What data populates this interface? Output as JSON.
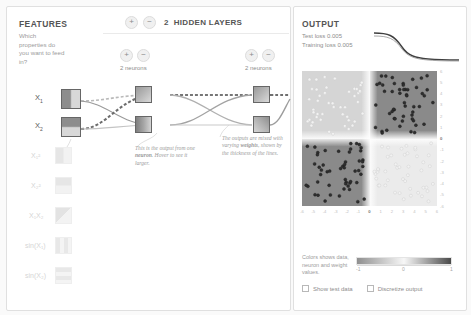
{
  "features": {
    "title": "FEATURES",
    "subtitle": "Which properties do you want to feed in?",
    "active": [
      {
        "label": "X",
        "sub": "1",
        "name": "input-x1"
      },
      {
        "label": "X",
        "sub": "2",
        "name": "input-x2"
      }
    ],
    "inactive": [
      {
        "label": "X₁²"
      },
      {
        "label": "X₂²"
      },
      {
        "label": "X₁X₂"
      },
      {
        "label": "sin(X₁)"
      },
      {
        "label": "sin(X₂)"
      }
    ]
  },
  "network": {
    "add_label": "+",
    "remove_label": "−",
    "layers_count": "2",
    "layers_label": "HIDDEN LAYERS",
    "layer1_neurons": "2 neurons",
    "layer2_neurons": "2 neurons"
  },
  "annotations": {
    "neuron_pre": "This is the output from one ",
    "neuron_bold": "neuron",
    "neuron_post": ". Hover to see it larger.",
    "weights_pre": "The outputs are mixed with varying ",
    "weights_bold": "weights",
    "weights_post": ", shown by the thickness of the lines."
  },
  "output": {
    "title": "OUTPUT",
    "test_loss": "Test loss 0.005",
    "training_loss": "Training loss 0.005",
    "x_ticks": [
      "-6",
      "-5",
      "-4",
      "-3",
      "-2",
      "-1",
      "0",
      "1",
      "2",
      "3",
      "4",
      "5",
      "6"
    ],
    "y_ticks": [
      "6",
      "5",
      "4",
      "3",
      "2",
      "1",
      "0",
      "-1",
      "-2",
      "-3",
      "-4",
      "-5",
      "-6"
    ],
    "legend_text": "Colors shows data, neuron and weight values.",
    "legend_min": "-1",
    "legend_mid": "0",
    "legend_max": "1",
    "show_test_data": "Show test data",
    "discretize_output": "Discretize output"
  },
  "colors": {
    "positive": "#4a4a4a",
    "negative": "#8f8f8f",
    "neutral": "#f7f7f7",
    "text": "#555555",
    "muted": "#9b9b9b"
  }
}
